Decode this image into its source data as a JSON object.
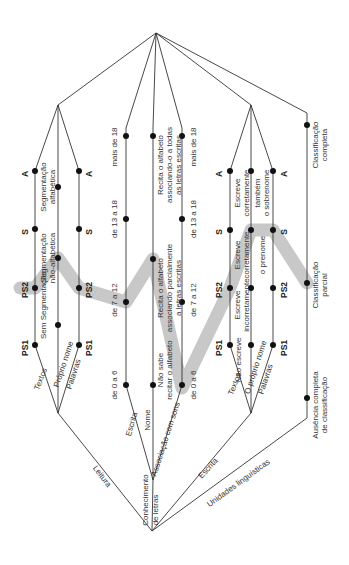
{
  "diagram": {
    "orientation": "rotated-90",
    "highlight_color": "#c8c8c8",
    "root_labels": {
      "leitura": "Leitura",
      "conhecimento_line1": "Conhecimento",
      "conhecimento_line2": "de letras",
      "escrita": "Escrita",
      "unidades": "Unidades linguísticas"
    },
    "leitura": {
      "branches": [
        "Textos",
        "Próprio nome",
        "Palavras"
      ],
      "levels": {
        "ps1": "PS1",
        "ps2": "PS2",
        "s": "S",
        "a": "A"
      },
      "middle_labels": [
        "Sem Segmentação",
        "Segmentação não-alfabética",
        "Segmentação alfabética"
      ]
    },
    "conhecimento": {
      "branches": [
        "Escrita",
        "Nome",
        "Associação com sons"
      ],
      "escrita_ranges": [
        "de 0 a 6",
        "de 7 a 12",
        "de 13 a 18",
        "mais de 18"
      ],
      "nome_labels": [
        "Não sabe recitar o alfabeto",
        "Recita o alfabeto associando parcialmente a letras escritas",
        "Recita o alfabeto associando-o a todas as letras escritas"
      ],
      "assoc_ranges": [
        "de 0 a 6",
        "de 7 a 12",
        "de 13 a 18",
        "mais de 18"
      ]
    },
    "escrita": {
      "branches": [
        "Textos",
        "O próprio nome",
        "Palavras"
      ],
      "levels": {
        "ps1": "PS1",
        "ps2": "PS2",
        "s": "S",
        "a": "A"
      },
      "textos_labels": [
        "Não escreve",
        "Escreve incorretamente",
        "Escreve corretamente",
        "Escreve corretamente"
      ],
      "nome_labels": [
        "o prenome",
        "também o sobrenome"
      ]
    },
    "unidades": {
      "labels": [
        "Ausência completa de classificação",
        "Classificação parcial",
        "Classificação completa"
      ]
    }
  }
}
